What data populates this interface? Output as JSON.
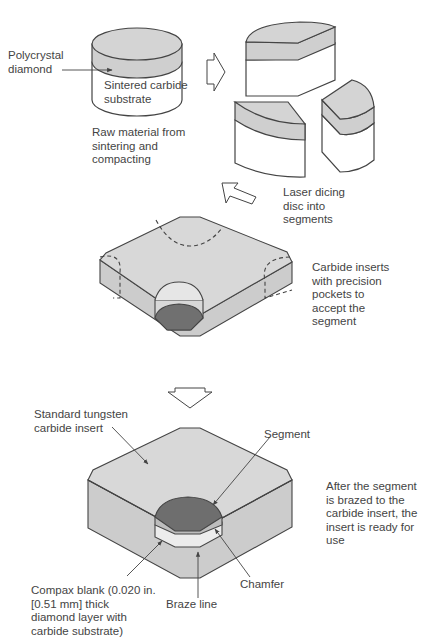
{
  "diagram": {
    "colors": {
      "diamond_layer": "#cfcfcf",
      "insert_body": "#d8d8d8",
      "pocket_floor": "#707070",
      "segment_top": "#6e6e6e",
      "outline": "#444444",
      "substrate": "#ffffff"
    },
    "labels": {
      "polycrystal_diamond": "Polycrystal\ndiamond",
      "sintered_substrate": "Sintered carbide\nsubstrate",
      "raw_material": "Raw material from\nsintering and\ncompacting",
      "laser_dicing": "Laser dicing\ndisc into\nsegments",
      "carbide_inserts": "Carbide inserts\nwith precision\npockets to\naccept the\nsegment",
      "standard_insert": "Standard tungsten\ncarbide insert",
      "segment": "Segment",
      "after_brazed": "After the segment\nis brazed to the\ncarbide insert, the\ninsert is ready for\nuse",
      "chamfer": "Chamfer",
      "braze_line": "Braze line",
      "compax_blank": "Compax blank (0.020 in.\n[0.51 mm] thick\ndiamond layer with\ncarbide substrate)"
    },
    "steps": [
      {
        "name": "raw-disc",
        "description": "Raw material from sintering and compacting"
      },
      {
        "name": "diced-segments",
        "description": "Laser dicing disc into segments"
      },
      {
        "name": "pocketed-insert",
        "description": "Carbide inserts with precision pockets to accept the segment"
      },
      {
        "name": "finished-insert",
        "description": "After the segment is brazed to the carbide insert, the insert is ready for use"
      }
    ]
  }
}
